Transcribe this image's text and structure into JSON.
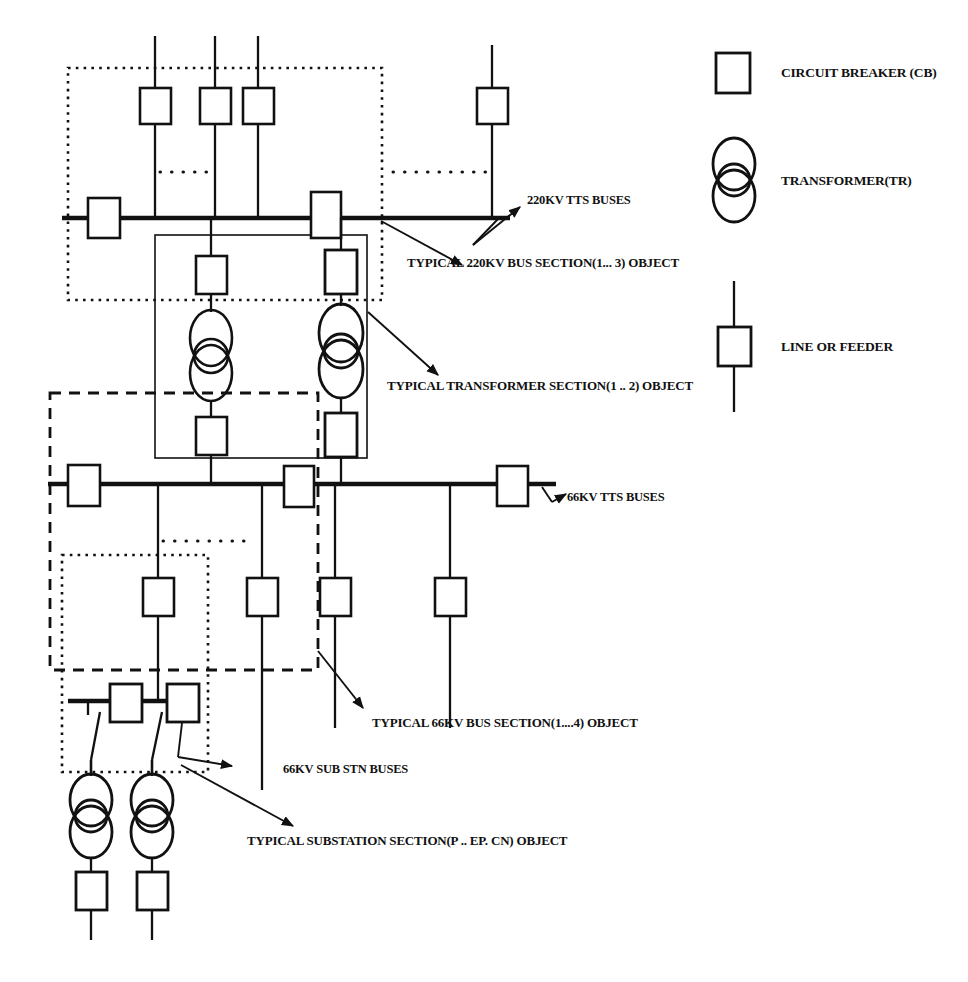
{
  "diagram": {
    "kind": "electrical-single-line-diagram",
    "title_present": false,
    "colors": {
      "ink": "#111111",
      "bus": "#000000",
      "background": "#ffffff"
    }
  },
  "legend": {
    "items": [
      {
        "symbol": "rectangle",
        "icon_name": "circuit-breaker-icon",
        "label": "CIRCUIT BREAKER  (CB)"
      },
      {
        "symbol": "two-overlapping-circles",
        "icon_name": "transformer-icon",
        "label": "TRANSFORMER(TR)"
      },
      {
        "symbol": "vertical-line-with-box",
        "icon_name": "line-feeder-icon",
        "label": "LINE OR FEEDER"
      }
    ]
  },
  "annotations": [
    {
      "id": "bus220",
      "text": "220KV TTS BUSES",
      "x": 527,
      "y": 200,
      "size": "sm"
    },
    {
      "id": "sect220",
      "text": "TYPICAL 220KV BUS SECTION(1... 3) OBJECT",
      "x": 407,
      "y": 262,
      "size": "md"
    },
    {
      "id": "secttr",
      "text": "TYPICAL TRANSFORMER  SECTION(1 .. 2) OBJECT",
      "x": 387,
      "y": 385,
      "size": "md"
    },
    {
      "id": "bus66",
      "text": "66KV TTS BUSES",
      "x": 567,
      "y": 497,
      "size": "sm"
    },
    {
      "id": "sect66",
      "text": "TYPICAL 66KV BUS SECTION(1....4)   OBJECT",
      "x": 372,
      "y": 722,
      "size": "md"
    },
    {
      "id": "bus66sub",
      "text": "66KV SUB STN BUSES",
      "x": 283,
      "y": 769,
      "size": "sm"
    },
    {
      "id": "sectsub",
      "text": "TYPICAL SUBSTATION SECTION(P .. EP.  CN) OBJECT",
      "x": 247,
      "y": 840,
      "size": "md"
    }
  ],
  "buses": [
    {
      "name": "220KV TTS bus",
      "y": 218,
      "x1": 62,
      "x2": 510
    },
    {
      "name": "66KV TTS bus",
      "y": 484,
      "x1": 48,
      "x2": 556
    },
    {
      "name": "66KV SUB STN bus",
      "y": 701,
      "x1": 68,
      "x2": 186
    }
  ],
  "sections": [
    {
      "name": "220KV bus section",
      "style": "dotted",
      "x": 68,
      "y": 68,
      "w": 314,
      "h": 232
    },
    {
      "name": "transformer section",
      "style": "solid",
      "x": 155,
      "y": 235,
      "w": 212,
      "h": 223
    },
    {
      "name": "66KV bus section",
      "style": "dashed",
      "x": 50,
      "y": 393,
      "w": 268,
      "h": 277
    },
    {
      "name": "substation section",
      "style": "dotted",
      "x": 62,
      "y": 555,
      "w": 146,
      "h": 217
    }
  ],
  "counts": {
    "top_feeders_220kv": 4,
    "transformer_branches": 2,
    "feeders_66kv": 4,
    "substation_transformers": 2
  }
}
